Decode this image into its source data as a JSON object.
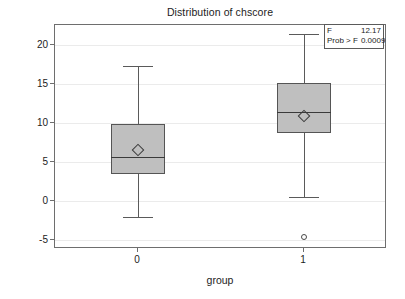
{
  "chart_data": {
    "type": "box",
    "title": "Distribution of chscore",
    "xlabel": "group",
    "ylabel": "chscore",
    "categories": [
      "0",
      "1"
    ],
    "ylim": [
      -6.2,
      22.5
    ],
    "yticks": [
      20,
      15,
      10,
      5,
      0,
      -5
    ],
    "ytick_labels": [
      "20",
      "15",
      "10",
      "5",
      "0",
      "-5"
    ],
    "grid": true,
    "legend": "none",
    "boxes": [
      {
        "category": "0",
        "whisker_low": -2.1,
        "q1": 3.4,
        "median": 5.6,
        "q3": 9.8,
        "whisker_high": 17.2,
        "mean": 6.5,
        "outliers": []
      },
      {
        "category": "1",
        "whisker_low": 0.4,
        "q1": 8.6,
        "median": 11.3,
        "q3": 15.1,
        "whisker_high": 21.3,
        "mean": 10.9,
        "outliers": [
          -4.6
        ]
      }
    ],
    "annotation": {
      "rows": [
        {
          "key": "F",
          "value": "12.17"
        },
        {
          "key": "Prob > F",
          "value": "0.0009"
        }
      ]
    },
    "colors": {
      "box_fill": "#bfbfbf",
      "box_edge": "#555555",
      "median": "#3a3a3a",
      "whisker": "#5a5a5a",
      "grid": "#ebebeb",
      "frame": "#6e6e6e",
      "background": "#ffffff"
    }
  }
}
